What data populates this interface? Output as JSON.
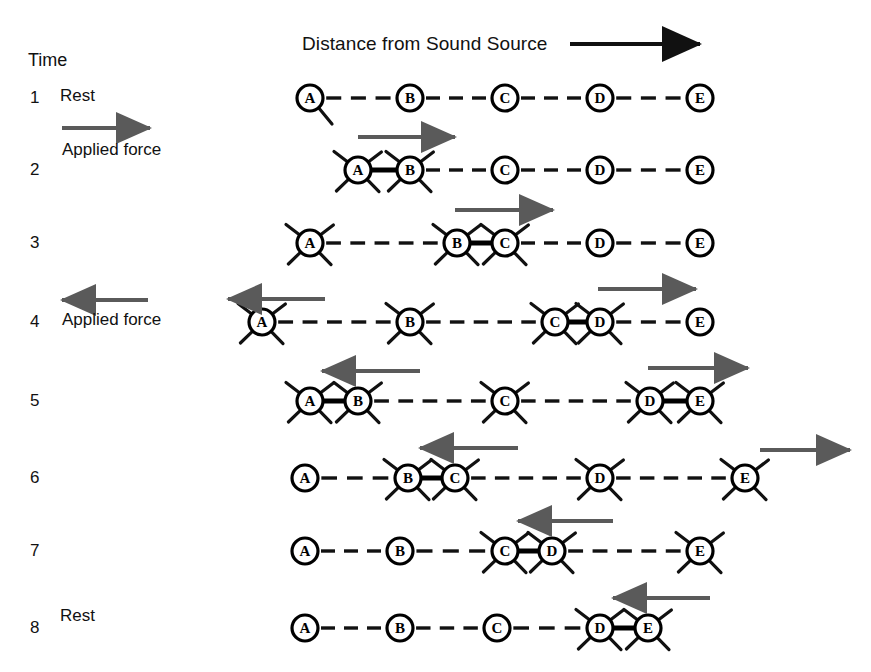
{
  "header": {
    "time_label": "Time",
    "axis_label": "Distance from Sound Source",
    "axis_arrow": "right-arrow-icon"
  },
  "colors": {
    "ink": "#111111",
    "arrow": "#5a5a5a",
    "bond": "#000000"
  },
  "legend": {
    "applied_force_right": "Applied force",
    "applied_force_left": "Applied force"
  },
  "particles": [
    "A",
    "B",
    "C",
    "D",
    "E"
  ],
  "rest_positions_x": [
    310,
    410,
    505,
    600,
    700
  ],
  "rows": [
    {
      "num": "1",
      "state": "Rest",
      "y": 98,
      "nodes": [
        {
          "label": "A",
          "x": 310,
          "vibrating": false
        },
        {
          "label": "B",
          "x": 410,
          "vibrating": false
        },
        {
          "label": "C",
          "x": 505,
          "vibrating": false
        },
        {
          "label": "D",
          "x": 600,
          "vibrating": false
        },
        {
          "label": "E",
          "x": 700,
          "vibrating": false
        }
      ],
      "bonds": [],
      "arrows": []
    },
    {
      "num": "2",
      "state": "",
      "y": 170,
      "nodes": [
        {
          "label": "A",
          "x": 358,
          "vibrating": true
        },
        {
          "label": "B",
          "x": 410,
          "vibrating": true
        },
        {
          "label": "C",
          "x": 505,
          "vibrating": false
        },
        {
          "label": "D",
          "x": 600,
          "vibrating": false
        },
        {
          "label": "E",
          "x": 700,
          "vibrating": false
        }
      ],
      "bonds": [
        [
          0,
          1
        ]
      ],
      "arrows": [
        {
          "x1": 358,
          "x2": 455,
          "y": -33,
          "dir": "right"
        }
      ]
    },
    {
      "num": "3",
      "state": "",
      "y": 243,
      "nodes": [
        {
          "label": "A",
          "x": 310,
          "vibrating": true
        },
        {
          "label": "B",
          "x": 457,
          "vibrating": true
        },
        {
          "label": "C",
          "x": 505,
          "vibrating": true
        },
        {
          "label": "D",
          "x": 600,
          "vibrating": false
        },
        {
          "label": "E",
          "x": 700,
          "vibrating": false
        }
      ],
      "bonds": [
        [
          1,
          2
        ]
      ],
      "arrows": [
        {
          "x1": 455,
          "x2": 553,
          "y": -33,
          "dir": "right"
        }
      ]
    },
    {
      "num": "4",
      "state": "",
      "y": 322,
      "nodes": [
        {
          "label": "A",
          "x": 262,
          "vibrating": true
        },
        {
          "label": "B",
          "x": 410,
          "vibrating": true
        },
        {
          "label": "C",
          "x": 555,
          "vibrating": true
        },
        {
          "label": "D",
          "x": 600,
          "vibrating": true
        },
        {
          "label": "E",
          "x": 700,
          "vibrating": false
        }
      ],
      "bonds": [
        [
          2,
          3
        ]
      ],
      "arrows": [
        {
          "x1": 325,
          "x2": 228,
          "y": -23,
          "dir": "left"
        },
        {
          "x1": 598,
          "x2": 696,
          "y": -33,
          "dir": "right"
        }
      ]
    },
    {
      "num": "5",
      "state": "",
      "y": 401,
      "nodes": [
        {
          "label": "A",
          "x": 310,
          "vibrating": true
        },
        {
          "label": "B",
          "x": 358,
          "vibrating": true
        },
        {
          "label": "C",
          "x": 505,
          "vibrating": true
        },
        {
          "label": "D",
          "x": 650,
          "vibrating": true
        },
        {
          "label": "E",
          "x": 700,
          "vibrating": true
        }
      ],
      "bonds": [
        [
          0,
          1
        ],
        [
          3,
          4
        ]
      ],
      "arrows": [
        {
          "x1": 420,
          "x2": 322,
          "y": -30,
          "dir": "left"
        },
        {
          "x1": 648,
          "x2": 748,
          "y": -33,
          "dir": "right"
        }
      ]
    },
    {
      "num": "6",
      "state": "",
      "y": 478,
      "nodes": [
        {
          "label": "A",
          "x": 305,
          "vibrating": false
        },
        {
          "label": "B",
          "x": 408,
          "vibrating": true
        },
        {
          "label": "C",
          "x": 455,
          "vibrating": true
        },
        {
          "label": "D",
          "x": 600,
          "vibrating": true
        },
        {
          "label": "E",
          "x": 745,
          "vibrating": true
        }
      ],
      "bonds": [
        [
          1,
          2
        ]
      ],
      "arrows": [
        {
          "x1": 518,
          "x2": 420,
          "y": -30,
          "dir": "left"
        },
        {
          "x1": 760,
          "x2": 850,
          "y": -28,
          "dir": "right"
        }
      ]
    },
    {
      "num": "7",
      "state": "",
      "y": 551,
      "nodes": [
        {
          "label": "A",
          "x": 305,
          "vibrating": false
        },
        {
          "label": "B",
          "x": 400,
          "vibrating": false
        },
        {
          "label": "C",
          "x": 505,
          "vibrating": true
        },
        {
          "label": "D",
          "x": 552,
          "vibrating": true
        },
        {
          "label": "E",
          "x": 700,
          "vibrating": true
        }
      ],
      "bonds": [
        [
          2,
          3
        ]
      ],
      "arrows": [
        {
          "x1": 613,
          "x2": 518,
          "y": -30,
          "dir": "left"
        }
      ]
    },
    {
      "num": "8",
      "state": "Rest",
      "y": 628,
      "nodes": [
        {
          "label": "A",
          "x": 305,
          "vibrating": false
        },
        {
          "label": "B",
          "x": 400,
          "vibrating": false
        },
        {
          "label": "C",
          "x": 497,
          "vibrating": false
        },
        {
          "label": "D",
          "x": 600,
          "vibrating": true
        },
        {
          "label": "E",
          "x": 648,
          "vibrating": true
        }
      ],
      "bonds": [
        [
          3,
          4
        ]
      ],
      "arrows": [
        {
          "x1": 710,
          "x2": 613,
          "y": -30,
          "dir": "left"
        }
      ]
    }
  ]
}
